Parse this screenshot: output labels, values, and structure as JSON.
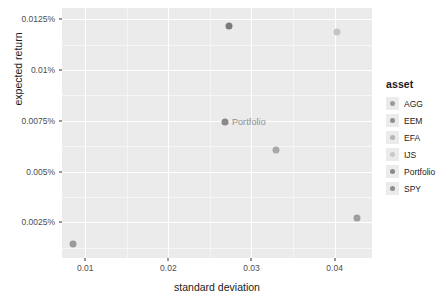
{
  "chart_data": {
    "type": "scatter",
    "title": "",
    "xlabel": "standard deviation",
    "ylabel": "expected return",
    "xlim": [
      0.0072,
      0.0445
    ],
    "ylim": [
      0.00075,
      0.01305
    ],
    "xticks": [
      "0.01",
      "0.02",
      "0.03",
      "0.04"
    ],
    "xtick_values": [
      0.01,
      0.02,
      0.03,
      0.04
    ],
    "yticks": [
      "0.0025%",
      "0.005%",
      "0.0075%",
      "0.01%",
      "0.0125%"
    ],
    "ytick_values": [
      0.0025,
      0.005,
      0.0075,
      0.01,
      0.0125
    ],
    "grid": true,
    "legend_title": "asset",
    "legend_position": "right",
    "points": [
      {
        "asset": "AGG",
        "x": 0.0085,
        "y": 0.00145,
        "color": "#9a9a9a",
        "label": ""
      },
      {
        "asset": "EEM",
        "x": 0.0273,
        "y": 0.01215,
        "color": "#7b7b7b",
        "label": ""
      },
      {
        "asset": "EFA",
        "x": 0.0403,
        "y": 0.01185,
        "color": "#c4c4c4",
        "label": ""
      },
      {
        "asset": "IJS",
        "x": 0.033,
        "y": 0.00605,
        "color": "#a8a8a8",
        "label": ""
      },
      {
        "asset": "Portfolio",
        "x": 0.0268,
        "y": 0.00745,
        "color": "#8a8a8a",
        "label": "Portfolio"
      },
      {
        "asset": "SPY",
        "x": 0.0427,
        "y": 0.00272,
        "color": "#9e9e9e",
        "label": ""
      }
    ],
    "legend_entries": [
      {
        "label": "AGG",
        "color": "#9a9a9a"
      },
      {
        "label": "EEM",
        "color": "#8f8f8f"
      },
      {
        "label": "EFA",
        "color": "#b5b5b5"
      },
      {
        "label": "IJS",
        "color": "#c8c8c8"
      },
      {
        "label": "Portfolio",
        "color": "#8a8a8a"
      },
      {
        "label": "SPY",
        "color": "#8d8d8d"
      }
    ],
    "panel_background": "#ebebeb",
    "gridline_color": "#ffffff"
  },
  "axis": {
    "x_title": "standard deviation",
    "y_title": "expected return"
  },
  "legend": {
    "title": "asset"
  }
}
